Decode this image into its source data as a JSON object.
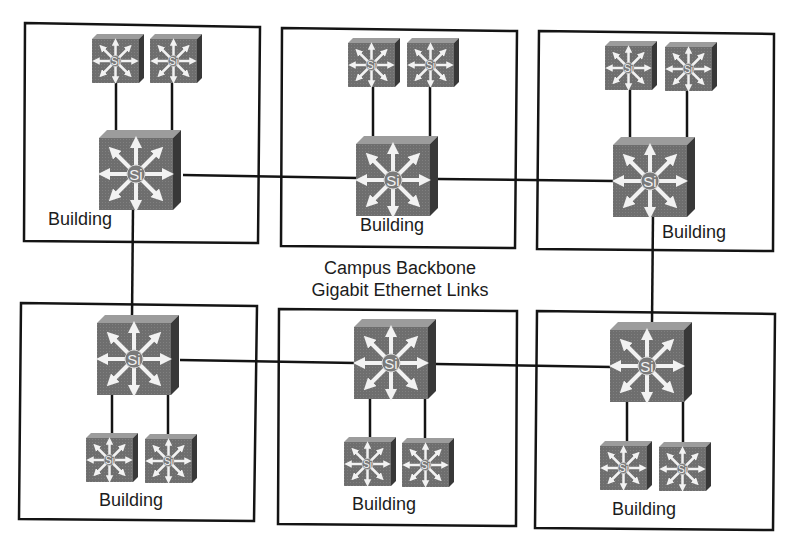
{
  "diagram": {
    "type": "campus-network-topology",
    "caption": {
      "line1": "Campus Backbone",
      "line2": "Gigabit Ethernet Links"
    },
    "colors": {
      "switch_face": "#6e6e6e",
      "switch_top": "#9a9a9a",
      "switch_side": "#3c3c3c",
      "arrow": "#f2f2f2",
      "line": "#141414",
      "box_border": "#141414"
    },
    "switch_label": "Si",
    "buildings": [
      {
        "id": "b1",
        "label": "Building",
        "position": "top-left",
        "core_switch": "Si",
        "access_switches": [
          "Si",
          "Si"
        ]
      },
      {
        "id": "b2",
        "label": "Building",
        "position": "top-center",
        "core_switch": "Si",
        "access_switches": [
          "Si",
          "Si"
        ]
      },
      {
        "id": "b3",
        "label": "Building",
        "position": "top-right",
        "core_switch": "Si",
        "access_switches": [
          "Si",
          "Si"
        ]
      },
      {
        "id": "b4",
        "label": "Building",
        "position": "bottom-left",
        "core_switch": "Si",
        "access_switches": [
          "Si",
          "Si"
        ]
      },
      {
        "id": "b5",
        "label": "Building",
        "position": "bottom-center",
        "core_switch": "Si",
        "access_switches": [
          "Si",
          "Si"
        ]
      },
      {
        "id": "b6",
        "label": "Building",
        "position": "bottom-right",
        "core_switch": "Si",
        "access_switches": [
          "Si",
          "Si"
        ]
      }
    ],
    "backbone_links": [
      {
        "from": "b1",
        "to": "b2"
      },
      {
        "from": "b2",
        "to": "b3"
      },
      {
        "from": "b4",
        "to": "b5"
      },
      {
        "from": "b5",
        "to": "b6"
      },
      {
        "from": "b1",
        "to": "b4"
      },
      {
        "from": "b3",
        "to": "b6"
      }
    ]
  }
}
